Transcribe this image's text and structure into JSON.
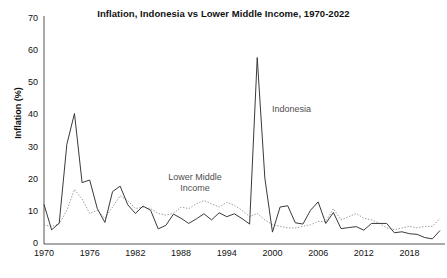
{
  "chart_data": {
    "type": "line",
    "title": "Inflation, Indonesia vs Lower Middle Income, 1970-2022",
    "xlabel": "",
    "ylabel": "Inflation (%)",
    "xlim": [
      1970,
      2022
    ],
    "ylim": [
      0,
      70
    ],
    "grid": false,
    "legend_position": "inline-annotation",
    "x_ticks": [
      "1970",
      "1976",
      "1982",
      "1988",
      "1994",
      "2000",
      "2006",
      "2012",
      "2018"
    ],
    "x_tick_values": [
      1970,
      1976,
      1982,
      1988,
      1994,
      2000,
      2006,
      2012,
      2018
    ],
    "y_ticks": [
      "0",
      "10",
      "20",
      "30",
      "40",
      "50",
      "60",
      "70"
    ],
    "y_tick_values": [
      0,
      10,
      20,
      30,
      40,
      50,
      60,
      70
    ],
    "x": [
      1970,
      1971,
      1972,
      1973,
      1974,
      1975,
      1976,
      1977,
      1978,
      1979,
      1980,
      1981,
      1982,
      1983,
      1984,
      1985,
      1986,
      1987,
      1988,
      1989,
      1990,
      1991,
      1992,
      1993,
      1994,
      1995,
      1996,
      1997,
      1998,
      1999,
      2000,
      2001,
      2002,
      2003,
      2004,
      2005,
      2006,
      2007,
      2008,
      2009,
      2010,
      2011,
      2012,
      2013,
      2014,
      2015,
      2016,
      2017,
      2018,
      2019,
      2020,
      2021,
      2022
    ],
    "series": [
      {
        "name": "Indonesia",
        "style": "solid",
        "color": "#3a3a3a",
        "values": [
          12.3,
          4.4,
          6.5,
          31.0,
          40.6,
          19.1,
          19.9,
          11.0,
          6.7,
          16.3,
          18.0,
          12.2,
          9.5,
          11.8,
          10.5,
          4.7,
          5.8,
          9.3,
          8.0,
          6.4,
          7.8,
          9.4,
          7.5,
          9.7,
          8.5,
          9.4,
          7.9,
          6.2,
          58.0,
          20.5,
          3.7,
          11.5,
          11.9,
          6.6,
          6.2,
          10.5,
          13.1,
          6.4,
          9.8,
          4.8,
          5.1,
          5.4,
          4.3,
          6.4,
          6.4,
          6.4,
          3.5,
          3.8,
          3.2,
          3.0,
          2.0,
          1.6,
          4.2
        ]
      },
      {
        "name": "Lower Middle Income",
        "style": "dotted",
        "color": "#9a9a9a",
        "values": [
          5.9,
          5.5,
          6.2,
          10.5,
          17.0,
          14.0,
          9.5,
          10.5,
          8.0,
          11.5,
          15.0,
          13.5,
          11.0,
          11.5,
          11.0,
          9.5,
          9.0,
          9.5,
          11.5,
          11.0,
          12.5,
          13.5,
          12.5,
          11.5,
          13.0,
          12.0,
          10.5,
          8.5,
          9.5,
          7.5,
          6.0,
          5.5,
          5.0,
          5.0,
          5.5,
          6.0,
          7.0,
          7.0,
          11.0,
          7.5,
          8.5,
          9.5,
          8.0,
          7.5,
          6.5,
          5.0,
          4.5,
          5.0,
          5.5,
          5.0,
          5.5,
          5.5,
          8.0
        ]
      }
    ],
    "annotations": [
      {
        "text": "Indonesia",
        "series": "Indonesia"
      },
      {
        "text": "Lower Middle\nIncome",
        "series": "Lower Middle Income"
      }
    ]
  },
  "annotations": {
    "lower_middle_income_line1": "Lower Middle",
    "lower_middle_income_line2": "Income",
    "indonesia": "Indonesia"
  }
}
